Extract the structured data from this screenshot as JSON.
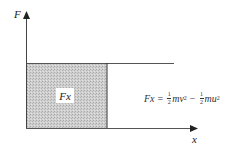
{
  "diagram": {
    "y_axis_label": "F",
    "x_axis_label": "x",
    "area_label": "Fx",
    "equation": {
      "lhs": "Fx",
      "equals": "=",
      "term1": {
        "frac_num": "1",
        "frac_den": "2",
        "body": "mv",
        "exp": "2"
      },
      "minus": "−",
      "term2": {
        "frac_num": "1",
        "frac_den": "2",
        "body": "mu",
        "exp": "2"
      }
    },
    "colors": {
      "axis": "#333333",
      "shade": "#c8c8c8",
      "line": "#555555"
    }
  }
}
